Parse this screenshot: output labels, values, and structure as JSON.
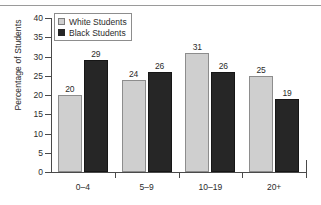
{
  "chart_data": {
    "type": "bar",
    "title": "",
    "xlabel": "",
    "ylabel": "Percentage of Students",
    "categories": [
      "0–4",
      "5–9",
      "10–19",
      "20+"
    ],
    "series": [
      {
        "name": "White Students",
        "values": [
          20,
          24,
          31,
          25
        ],
        "color": "#cfcfcf"
      },
      {
        "name": "Black Students",
        "values": [
          29,
          26,
          26,
          19
        ],
        "color": "#262626"
      }
    ],
    "ylim": [
      0,
      40
    ],
    "yticks": [
      0,
      5,
      10,
      15,
      20,
      25,
      30,
      35,
      40
    ],
    "ytick_labels": [
      "0",
      "5",
      "10",
      "15",
      "20",
      "25",
      "30",
      "35",
      "40"
    ],
    "grid": false,
    "legend_position": "top-left",
    "data_labels": true
  },
  "legend": {
    "items": [
      {
        "label": "White Students",
        "swatch": "white-series"
      },
      {
        "label": "Black Students",
        "swatch": "black-series"
      }
    ]
  }
}
